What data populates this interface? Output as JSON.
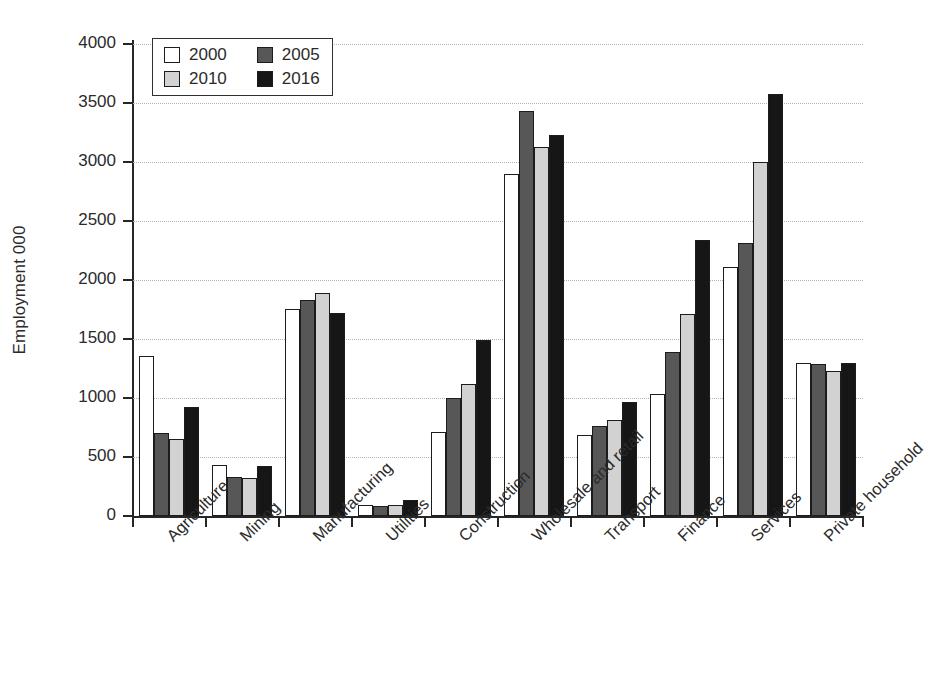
{
  "chart_data": {
    "type": "bar",
    "title": "",
    "xlabel": "",
    "ylabel": "Employment 000",
    "ylim": [
      0,
      4000
    ],
    "ytick_step": 500,
    "yticks": [
      "4000",
      "3500",
      "3000",
      "2500",
      "2000",
      "1500",
      "1000",
      "500",
      "0"
    ],
    "grid": "horizontal-dotted",
    "legend_position": "top-left-inside",
    "categories": [
      "Agriculture",
      "Mining",
      "Manufacturing",
      "Utilities",
      "Construction",
      "Wholesale and retail",
      "Transport",
      "Finance",
      "Services",
      "Private household"
    ],
    "series": [
      {
        "name": "2000",
        "color": "#ffffff",
        "values": [
          1360,
          430,
          1755,
          90,
          710,
          2900,
          690,
          1030,
          2110,
          1300
        ]
      },
      {
        "name": "2005",
        "color": "#575757",
        "values": [
          700,
          330,
          1830,
          85,
          1000,
          3430,
          760,
          1390,
          2310,
          1290
        ]
      },
      {
        "name": "2010",
        "color": "#d2d2d2",
        "values": [
          650,
          320,
          1890,
          95,
          1115,
          3130,
          810,
          1710,
          3000,
          1230
        ]
      },
      {
        "name": "2016",
        "color": "#161616",
        "values": [
          925,
          420,
          1720,
          135,
          1490,
          3230,
          965,
          2340,
          3580,
          1300
        ]
      }
    ]
  },
  "legend": {
    "items": [
      {
        "label": "2000",
        "swatch": "white-square-icon"
      },
      {
        "label": "2005",
        "swatch": "dark-gray-square-icon"
      },
      {
        "label": "2010",
        "swatch": "light-gray-square-icon"
      },
      {
        "label": "2016",
        "swatch": "black-square-icon"
      }
    ]
  },
  "colors": {
    "axis": "#262626",
    "gridline": "#b4b4b4",
    "text": "#2b2b2b",
    "background": "#ffffff"
  }
}
